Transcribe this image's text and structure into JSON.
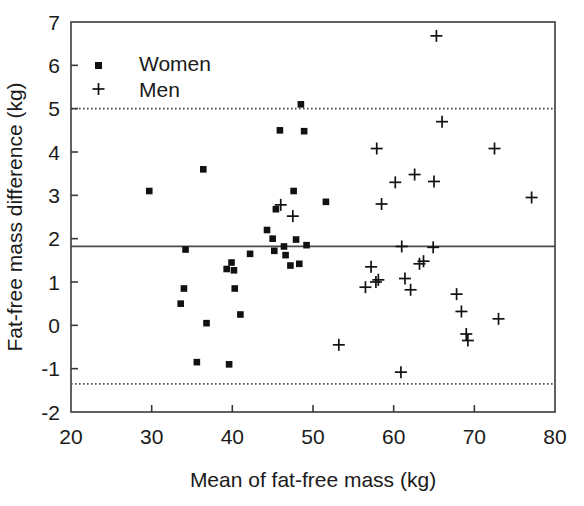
{
  "chart_data": {
    "type": "scatter",
    "title": "",
    "xlabel": "Mean of fat-free mass (kg)",
    "ylabel": "Fat-free mass difference (kg)",
    "xlim": [
      20,
      80
    ],
    "ylim": [
      -2,
      7
    ],
    "xticks": [
      20,
      30,
      40,
      50,
      60,
      70,
      80
    ],
    "yticks": [
      -2,
      -1,
      0,
      1,
      2,
      3,
      4,
      5,
      6,
      7
    ],
    "xticklabels": [
      "20",
      "30",
      "40",
      "50",
      "60",
      "70",
      "80"
    ],
    "yticklabels": [
      "-2",
      "-1",
      "0",
      "1",
      "2",
      "3",
      "4",
      "5",
      "6",
      "7"
    ],
    "grid": false,
    "legend_position": "top-left",
    "reference_lines": [
      {
        "name": "upper-limit-of-agreement",
        "y": 5.0,
        "style": "dotted",
        "label": ""
      },
      {
        "name": "mean-bias",
        "y": 1.82,
        "style": "solid",
        "label": ""
      },
      {
        "name": "lower-limit-of-agreement",
        "y": -1.35,
        "style": "dotted",
        "label": ""
      }
    ],
    "series": [
      {
        "name": "Women",
        "marker": "square",
        "points": [
          [
            29.7,
            3.1
          ],
          [
            33.6,
            0.5
          ],
          [
            34.0,
            0.85
          ],
          [
            34.2,
            1.75
          ],
          [
            35.6,
            -0.85
          ],
          [
            36.4,
            3.6
          ],
          [
            36.8,
            0.05
          ],
          [
            39.3,
            1.3
          ],
          [
            39.6,
            -0.9
          ],
          [
            39.9,
            1.45
          ],
          [
            40.2,
            1.27
          ],
          [
            40.3,
            0.85
          ],
          [
            41.0,
            0.25
          ],
          [
            42.2,
            1.65
          ],
          [
            44.3,
            2.2
          ],
          [
            45.0,
            2.0
          ],
          [
            45.2,
            1.72
          ],
          [
            45.4,
            2.68
          ],
          [
            45.9,
            4.5
          ],
          [
            46.4,
            1.82
          ],
          [
            46.6,
            1.62
          ],
          [
            47.2,
            1.38
          ],
          [
            47.6,
            3.1
          ],
          [
            47.9,
            1.98
          ],
          [
            48.3,
            1.42
          ],
          [
            48.5,
            5.1
          ],
          [
            48.9,
            4.48
          ],
          [
            49.2,
            1.85
          ],
          [
            51.6,
            2.85
          ]
        ]
      },
      {
        "name": "Men",
        "marker": "plus",
        "points": [
          [
            46.0,
            2.78
          ],
          [
            47.5,
            2.52
          ],
          [
            53.2,
            -0.45
          ],
          [
            56.5,
            0.88
          ],
          [
            57.2,
            1.35
          ],
          [
            57.8,
            1.0
          ],
          [
            57.9,
            4.08
          ],
          [
            58.1,
            1.05
          ],
          [
            58.5,
            2.8
          ],
          [
            60.2,
            3.3
          ],
          [
            60.9,
            -1.08
          ],
          [
            61.0,
            1.82
          ],
          [
            61.4,
            1.08
          ],
          [
            62.1,
            0.82
          ],
          [
            62.6,
            3.48
          ],
          [
            63.2,
            1.42
          ],
          [
            63.7,
            1.48
          ],
          [
            64.9,
            1.8
          ],
          [
            65.0,
            3.32
          ],
          [
            65.3,
            6.68
          ],
          [
            66.0,
            4.7
          ],
          [
            67.8,
            0.72
          ],
          [
            68.4,
            0.32
          ],
          [
            69.0,
            -0.2
          ],
          [
            69.2,
            -0.35
          ],
          [
            72.5,
            4.08
          ],
          [
            73.0,
            0.15
          ],
          [
            77.1,
            2.95
          ]
        ]
      }
    ]
  },
  "legend": {
    "items": [
      {
        "label": "Women",
        "marker": "square"
      },
      {
        "label": "Men",
        "marker": "plus"
      }
    ]
  }
}
